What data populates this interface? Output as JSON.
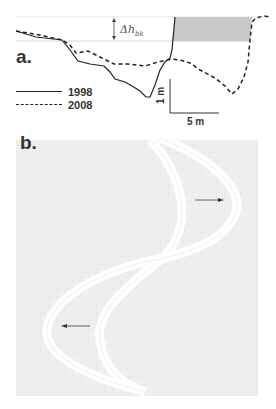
{
  "panel_a": {
    "label": "a.",
    "delta_symbol": "Δh",
    "delta_subscript": "bk",
    "legend": [
      {
        "label": "1998",
        "style": "solid"
      },
      {
        "label": "2008",
        "style": "dashed"
      }
    ],
    "scale_bar": {
      "vertical": "1 m",
      "horizontal": "5 m"
    },
    "colors": {
      "line": "#222222",
      "fill": "#c8c8c8",
      "reference_lines": "#cccccc"
    }
  },
  "panel_b": {
    "label": "b.",
    "arrows": [
      {
        "direction": "right",
        "location": "upper bend"
      },
      {
        "direction": "left",
        "location": "lower bend"
      }
    ],
    "colors": {
      "background": "#efefef",
      "channel": "#ffffff",
      "arrow": "#444444"
    }
  }
}
